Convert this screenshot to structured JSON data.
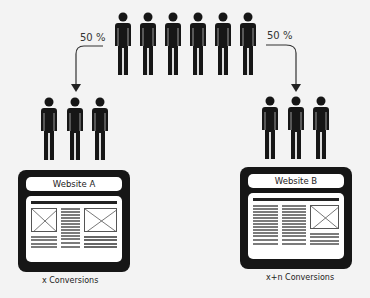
{
  "diagram": {
    "split_labels": {
      "left": "50 %",
      "right": "50 %"
    },
    "top_group_count": 6,
    "variants": [
      {
        "name": "Website A",
        "visitor_count": 3,
        "result": "x Conversions"
      },
      {
        "name": "Website B",
        "visitor_count": 3,
        "result": "x+n Conversions"
      }
    ],
    "colors": {
      "ink": "#161616",
      "background": "#f3f3f3",
      "page": "#ffffff"
    }
  }
}
